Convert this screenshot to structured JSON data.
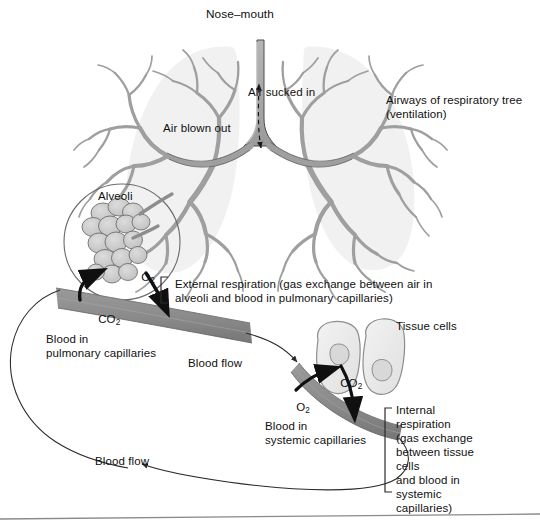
{
  "figure": {
    "type": "biology-diagram",
    "background_color": "#ffffff",
    "ink_color": "#101010"
  },
  "palette": {
    "lung_fill": "#f1f1f1",
    "bronchi_fill": "#a8a8a8",
    "bronchi_stroke": "#4d4d4d",
    "vessel_fill": "#8c8c8c",
    "vessel_dark": "#6f6f6f",
    "alveoli_fill": "#c9c9c9",
    "alveoli_stroke": "#5a5a5a",
    "cell_fill": "#ededed",
    "cell_stroke": "#8d8d8d",
    "nucleus_fill": "#d8d8d8",
    "line": "#2b2b2b",
    "rule": "#8a8a8a"
  },
  "labels": {
    "nose_mouth": "Nose–mouth",
    "air_sucked_in": "Air sucked in",
    "air_blown_out": "Air blown out",
    "airways_line1": "Airways of respiratory tree",
    "airways_line2": "(ventilation)",
    "alveoli": "Alveoli",
    "o2_alveoli": "O",
    "o2_alveoli_sub": "2",
    "co2_pulmonary": "CO",
    "co2_pulmonary_sub": "2",
    "external_line1": "External respiration (gas exchange between air in",
    "external_line2": "alveoli and blood in pulmonary capillaries)",
    "blood_pulmonary_line1": "Blood in",
    "blood_pulmonary_line2": "pulmonary capillaries",
    "blood_flow_upper": "Blood flow",
    "blood_flow_lower": "Blood flow",
    "tissue_cells": "Tissue cells",
    "co2_tissue": "CO",
    "co2_tissue_sub": "2",
    "o2_systemic": "O",
    "o2_systemic_sub": "2",
    "blood_systemic_line1": "Blood in",
    "blood_systemic_line2": "systemic capillaries",
    "internal_lines": [
      "Internal",
      "respiration",
      "(gas exchange",
      "between tissue",
      "cells",
      "and blood in",
      "systemic",
      "capillaries)"
    ]
  },
  "annotations": {
    "brace_external": "square-bracket-left",
    "brace_internal": "square-bracket-left",
    "trachea_arrow": "double-headed-dashed-vertical-arrow",
    "gas_arrows": [
      "co2-out-to-alveoli",
      "o2-in-from-alveoli",
      "o2-out-to-tissue",
      "co2-in-from-tissue"
    ],
    "flow_arrows": [
      "pulmonary-to-systemic",
      "systemic-to-pulmonary"
    ]
  }
}
